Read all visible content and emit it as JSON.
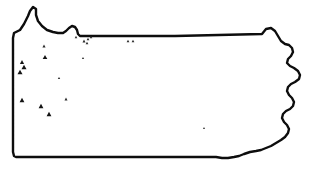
{
  "map": {
    "title": "Pennsylvania",
    "region_name": "Pennsylvania state outline distribution map",
    "alt_text": "Outline map of Pennsylvania with black triangle occurrence markers concentrated in the western and north-central counties",
    "colors": {
      "background": "#ffffff",
      "state_border": "#0d0d0d",
      "interior_line": "#8f8f8f",
      "water_body": "#9a9a9a",
      "marker_fill": "#141414",
      "marker_small_fill": "#2a2a2a"
    },
    "legend": {
      "marker_symbol": "triangle",
      "marker_meaning": "occurrence record"
    },
    "state_outline_path": "M 14,33 L 20,30 L 24,24 L 28,16 L 30,11 L 33,7 L 36,9 L 36,15 L 38,21 L 42,26 L 47,30 L 53,32 L 58,33 L 63,33 L 66,31 L 69,28 L 72,26 L 75,27 L 77,30 L 78,34 L 80,36 L 175,36 L 262,34 L 266,29 L 271,28 L 275,31 L 278,36 L 281,41 L 285,44 L 289,45 L 292,48 L 293,52 L 291,56 L 288,59 L 287,63 L 290,66 L 294,68 L 298,71 L 300,75 L 299,79 L 295,82 L 291,84 L 288,87 L 287,91 L 289,95 L 292,98 L 294,102 L 293,106 L 290,109 L 286,111 L 283,114 L 282,118 L 284,122 L 287,125 L 289,129 L 288,133 L 285,137 L 281,140 L 276,143 L 271,146 L 266,148 L 261,150 L 256,151 L 250,152 L 244,154 L 239,156 L 234,157 L 228,158 L 222,158 L 216,157 L 210,157 L 204,157 L 198,157 L 192,157 L 186,157 L 180,157 L 174,157 L 168,157 L 162,157 L 156,157 L 150,157 L 144,157 L 138,157 L 132,157 L 126,157 L 120,157 L 114,157 L 108,157 L 102,157 L 96,157 L 90,157 L 84,157 L 78,157 L 72,157 L 66,157 L 60,157 L 54,157 L 48,157 L 42,157 L 36,157 L 30,157 L 24,157 L 19,157 L 16,157 L 14,156 L 13,152 L 13,146 L 13,140 L 13,134 L 13,128 L 13,122 L 13,116 L 13,110 L 13,104 L 13,98 L 13,92 L 13,86 L 13,80 L 13,74 L 13,68 L 13,62 L 13,56 L 13,50 L 13,44 L 13,38 Z",
    "erie_notch_path": "M 22,27 L 27,18 L 31,12 L 34,9 L 36,12 L 36,18 L 39,24 L 44,29 L 50,32 L 57,34 L 63,34 L 68,30 L 73,27 L 76,29 L 78,33",
    "interior_lines": [
      {
        "name": "allegheny-river",
        "path": "M 39,35 L 38,40 L 36,45 L 33,50 L 30,54 L 27,58 L 25,62 L 23,66 L 22,70 L 21,74 L 20,78 L 19,82 L 18,86"
      },
      {
        "name": "northwest-county-line",
        "path": "M 20,36 L 22,41 L 25,45 L 28,48 L 31,50 L 34,51 L 37,50 L 40,48 L 43,45 L 46,43 L 49,42 L 52,42 L 55,43 L 58,45 L 61,47 L 64,48 L 67,48 L 70,47 L 73,45 L 76,43 L 79,41 L 82,39 L 85,38 L 88,37"
      },
      {
        "name": "susquehanna-west-branch",
        "path": "M 105,40 L 104,46 L 103,52 L 101,57 L 99,62 L 97,66 L 95,70 L 93,74 L 91,78 L 90,83 L 90,88 L 91,93 L 93,97 L 94,102 L 94,107 L 93,112 L 92,117 L 92,122 L 93,127 L 95,131 L 97,135 L 99,139 L 100,143 L 101,147 L 101,151 L 101,155"
      },
      {
        "name": "susquehanna-north-branch",
        "path": "M 231,37 L 230,42 L 229,47 L 228,52 L 227,57 L 226,62 L 226,67 L 227,72 L 228,77 L 229,82 L 230,87 L 231,92 L 232,97 L 232,102 L 231,107 L 229,111 L 227,115 L 225,119 L 224,123 L 224,127"
      },
      {
        "name": "northeast-ridge-line",
        "path": "M 180,37 L 181,42 L 182,47 L 183,52 L 184,57 L 183,62 L 181,66 L 178,70 L 175,74 L 172,78 L 169,82 L 166,86 L 164,90 L 163,95 L 163,100 L 164,105 L 166,109 L 169,113 L 172,116 L 175,119 L 178,122 L 181,125 L 184,128 L 187,131 L 190,134 L 193,136 L 197,138 L 201,139 L 205,140 L 209,141 L 213,142 L 217,143 L 221,145 L 225,147 L 229,149 L 233,151 L 237,153 L 241,154"
      },
      {
        "name": "south-central-ridges",
        "path": "M 101,155 L 104,151 L 108,148 L 112,146 L 116,144 L 120,143 L 124,143 L 128,144 L 132,145 L 136,145 L 140,144 L 144,143 L 148,142 L 152,141 L 156,140 L 160,139 L 164,139 L 168,140 L 172,141 L 176,142 L 180,143 L 184,144 L 188,145 L 192,146 L 196,147 L 200,148 L 204,149 L 208,150 L 212,151 L 216,152 L 220,153"
      },
      {
        "name": "laurel-highlands",
        "path": "M 90,95 L 88,100 L 87,105 L 86,110 L 86,115 L 87,120 L 88,125 L 89,130 L 90,135 L 91,140 L 92,145 L 93,150 L 93,155"
      },
      {
        "name": "potomac-tributary",
        "path": "M 101,153 L 99,149 L 96,146 L 93,144 L 89,143 L 85,143 L 81,144 L 77,145 L 73,146 L 69,147 L 65,147"
      }
    ],
    "water_bodies": [
      {
        "name": "raystown-lake",
        "path": "M 148,141 L 152,136 L 157,131 L 161,128 L 164,127 L 165,129 L 163,133 L 159,137 L 154,141 L 150,144 L 147,145 L 146,143 Z"
      }
    ],
    "site_markers": [
      {
        "id": "m01",
        "x": 20,
        "y": 72,
        "size": 5.0
      },
      {
        "id": "m02",
        "x": 24,
        "y": 67,
        "size": 5.0
      },
      {
        "id": "m03",
        "x": 22,
        "y": 62,
        "size": 4.2
      },
      {
        "id": "m04",
        "x": 45,
        "y": 57,
        "size": 4.6
      },
      {
        "id": "m05",
        "x": 44,
        "y": 46,
        "size": 3.2
      },
      {
        "id": "m06",
        "x": 22,
        "y": 100,
        "size": 4.8
      },
      {
        "id": "m07",
        "x": 41,
        "y": 106,
        "size": 4.8
      },
      {
        "id": "m08",
        "x": 49,
        "y": 114,
        "size": 4.8
      },
      {
        "id": "m09",
        "x": 66,
        "y": 99,
        "size": 3.0
      },
      {
        "id": "m10",
        "x": 59,
        "y": 78,
        "size": 2.4
      },
      {
        "id": "m11",
        "x": 76,
        "y": 37,
        "size": 2.6
      },
      {
        "id": "m12",
        "x": 84,
        "y": 41,
        "size": 3.0
      },
      {
        "id": "m13",
        "x": 88,
        "y": 39,
        "size": 2.8
      },
      {
        "id": "m14",
        "x": 91,
        "y": 37,
        "size": 2.6
      },
      {
        "id": "m15",
        "x": 87,
        "y": 43,
        "size": 2.8
      },
      {
        "id": "m16",
        "x": 128,
        "y": 41,
        "size": 2.8
      },
      {
        "id": "m17",
        "x": 133,
        "y": 41,
        "size": 2.8
      },
      {
        "id": "m18",
        "x": 83,
        "y": 58,
        "size": 2.2
      },
      {
        "id": "m19",
        "x": 204,
        "y": 128,
        "size": 2.0
      }
    ]
  }
}
